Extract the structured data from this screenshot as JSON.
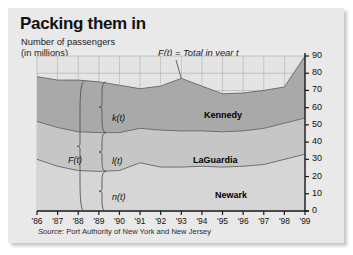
{
  "figure": {
    "title": "Packing them in",
    "subtitle_line1": "Number of passengers",
    "subtitle_line2": "(in millions)",
    "total_note": "F(t) = Total in year t",
    "source": "Source: Port Authority of New York and New Jersey",
    "source_prefix": "Source:",
    "source_rest": " Port Authority of New York and New Jersey"
  },
  "annotations": {
    "total_brace": "F(t)",
    "kennedy_brace": "k(t)",
    "laguardia_brace": "l(t)",
    "newark_brace": "n(t)"
  },
  "colors": {
    "panel": "#e9e9e9",
    "kennedy": "#a9a9a9",
    "laguardia": "#c6c6c6",
    "newark": "#d6d6d6",
    "grid": "#9a9a9a",
    "axis": "#1a1a1a",
    "curve": "#6e6e6e"
  },
  "chart_data": {
    "type": "area",
    "title": "Packing them in",
    "subtitle": "Number of passengers (in millions)",
    "xlabel": "",
    "ylabel": "Number of passengers (in millions)",
    "stacked": true,
    "grid": true,
    "legend_position": "inline-region-labels",
    "ylim": [
      0,
      90
    ],
    "yticks": [
      0,
      10,
      20,
      30,
      40,
      50,
      60,
      70,
      80,
      90
    ],
    "xticks": [
      "'86",
      "'87",
      "'88",
      "'89",
      "'90",
      "'91",
      "'92",
      "'93",
      "'94",
      "'95",
      "'96",
      "'97",
      "'98",
      "'99"
    ],
    "x": [
      1986,
      1987,
      1988,
      1989,
      1990,
      1991,
      1992,
      1993,
      1994,
      1995,
      1996,
      1997,
      1998,
      1999
    ],
    "series": [
      {
        "name": "Newark",
        "symbol": "n(t)",
        "values": [
          30,
          26,
          23.5,
          23,
          23.5,
          28,
          25.5,
          25.5,
          26,
          25.5,
          26,
          27,
          30,
          33
        ]
      },
      {
        "name": "LaGuardia",
        "symbol": "l(t)",
        "values": [
          22,
          22.5,
          22.5,
          22.5,
          22,
          20,
          21.5,
          21,
          20.5,
          20.5,
          20.5,
          21,
          21,
          21
        ]
      },
      {
        "name": "Kennedy",
        "symbol": "k(t)",
        "values": [
          26,
          27.5,
          30,
          29.5,
          27.5,
          23,
          25.5,
          30.5,
          26,
          22,
          22,
          22,
          21,
          36
        ]
      }
    ],
    "cumulative_boundaries": {
      "newark_top": [
        30,
        26,
        23.5,
        23,
        23.5,
        28,
        25.5,
        25.5,
        26,
        25.5,
        26,
        27,
        30,
        33
      ],
      "laguardia_top": [
        52,
        48.5,
        46,
        45.5,
        45.5,
        48,
        47,
        46.5,
        46.5,
        46,
        46.5,
        48,
        51,
        54
      ],
      "total": [
        78,
        76,
        76,
        75,
        73,
        71,
        72.5,
        77,
        72.5,
        68,
        68.5,
        70,
        72,
        90
      ]
    },
    "total_label": "F(t) = Total in year t",
    "region_labels": [
      "Kennedy",
      "LaGuardia",
      "Newark"
    ]
  }
}
